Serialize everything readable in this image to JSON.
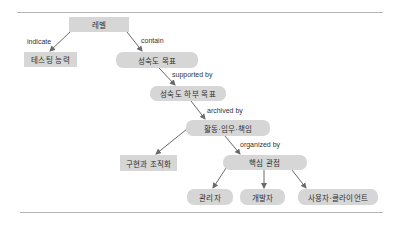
{
  "diagram": {
    "nodes": [
      {
        "id": "level",
        "label": "레벨",
        "shape": "rect"
      },
      {
        "id": "testing_capability",
        "label": "테스팅 능력",
        "shape": "rect"
      },
      {
        "id": "maturity_goal",
        "label": "성숙도 목표",
        "shape": "round"
      },
      {
        "id": "maturity_subgoal",
        "label": "성숙도 하부 목표",
        "shape": "round"
      },
      {
        "id": "activities",
        "label": "활동·임무·책임",
        "shape": "round"
      },
      {
        "id": "implementation",
        "label": "구현과 조직화",
        "shape": "rect"
      },
      {
        "id": "critical_views",
        "label": "핵심 관점",
        "shape": "round"
      },
      {
        "id": "manager",
        "label": "관리자",
        "shape": "round"
      },
      {
        "id": "developer",
        "label": "개발자",
        "shape": "round"
      },
      {
        "id": "user_client",
        "label": "사용자·클라이언트",
        "shape": "round"
      }
    ],
    "edges": [
      {
        "from": "level",
        "to": "testing_capability",
        "label": "indicate"
      },
      {
        "from": "level",
        "to": "maturity_goal",
        "label": "contain"
      },
      {
        "from": "maturity_goal",
        "to": "maturity_subgoal",
        "label": "supported by"
      },
      {
        "from": "maturity_subgoal",
        "to": "activities",
        "label": "archived by"
      },
      {
        "from": "activities",
        "to": "implementation",
        "label": ""
      },
      {
        "from": "activities",
        "to": "critical_views",
        "label": "organized by"
      },
      {
        "from": "critical_views",
        "to": "manager",
        "label": ""
      },
      {
        "from": "critical_views",
        "to": "developer",
        "label": ""
      },
      {
        "from": "critical_views",
        "to": "user_client",
        "label": ""
      }
    ],
    "colors": {
      "node_fill": "#d6d6d6",
      "node_text": "#2e2e2e",
      "arrow": "#6a6a6a",
      "rule": "#b5b5b5"
    }
  }
}
